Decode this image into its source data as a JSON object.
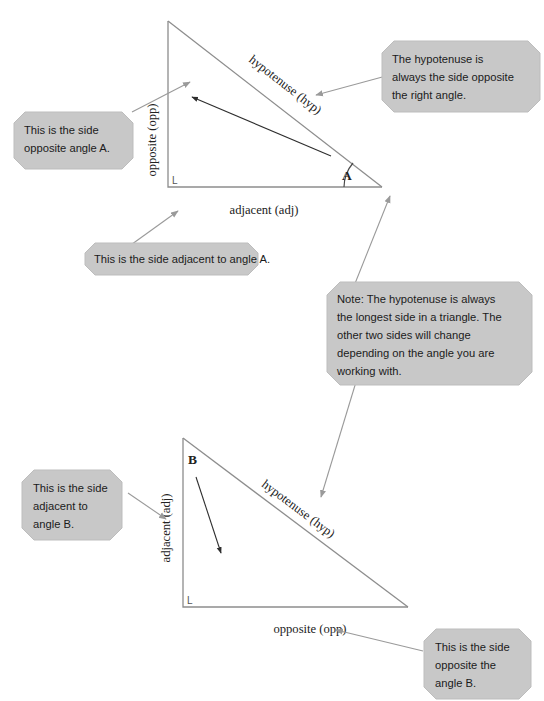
{
  "diagram": {
    "colors": {
      "callout_fill": "#c8c8c8",
      "callout_stroke": "#b4b4b4",
      "triangle_stroke": "#8d8d8d",
      "leader_stroke": "#9a9a9a",
      "inner_arrow_stroke": "#3a3a3a",
      "text": "#1b1b1b",
      "background": "#ffffff"
    }
  },
  "top_figure": {
    "name": "triangle-angle-a",
    "vertex_label": "A",
    "right_angle_mark": "L",
    "sides": {
      "vertical": "opposite (opp)",
      "horizontal": "adjacent (adj)",
      "diagonal": "hypotenuse (hyp)"
    }
  },
  "bottom_figure": {
    "name": "triangle-angle-b",
    "vertex_label": "B",
    "right_angle_mark": "L",
    "sides": {
      "vertical": "adjacent (adj)",
      "horizontal": "opposite (opp)",
      "diagonal": "hypotenuse (hyp)"
    }
  },
  "callouts": [
    {
      "id": "callout-hypotenuse-right-angle",
      "lines": [
        "The hypotenuse is",
        "always the side opposite",
        "the right angle."
      ]
    },
    {
      "id": "callout-opposite-angle-a",
      "lines": [
        "This is the side",
        "opposite angle A."
      ]
    },
    {
      "id": "callout-adjacent-angle-a",
      "lines": [
        "This is the side adjacent to angle A."
      ]
    },
    {
      "id": "callout-note-longest-side",
      "lines": [
        "Note: The hypotenuse is always",
        "the longest side in a triangle. The",
        "other two sides will change",
        "depending on the angle you are",
        "working with."
      ]
    },
    {
      "id": "callout-adjacent-angle-b",
      "lines": [
        "This is the side",
        "adjacent to",
        "angle B."
      ]
    },
    {
      "id": "callout-opposite-angle-b",
      "lines": [
        "This is the side",
        "opposite the",
        "angle B."
      ]
    }
  ]
}
